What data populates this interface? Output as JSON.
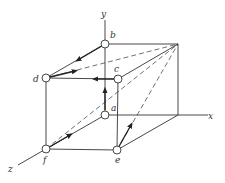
{
  "diagram": {
    "type": "cube-with-vectors",
    "axes": {
      "x": {
        "label": "x"
      },
      "y": {
        "label": "y"
      },
      "z": {
        "label": "z"
      }
    },
    "points": [
      {
        "id": "a",
        "label": "a"
      },
      {
        "id": "b",
        "label": "b"
      },
      {
        "id": "c",
        "label": "c"
      },
      {
        "id": "d",
        "label": "d"
      },
      {
        "id": "e",
        "label": "e"
      },
      {
        "id": "f",
        "label": "f"
      }
    ],
    "colors": {
      "line": "#333333",
      "background": "#ffffff"
    }
  }
}
